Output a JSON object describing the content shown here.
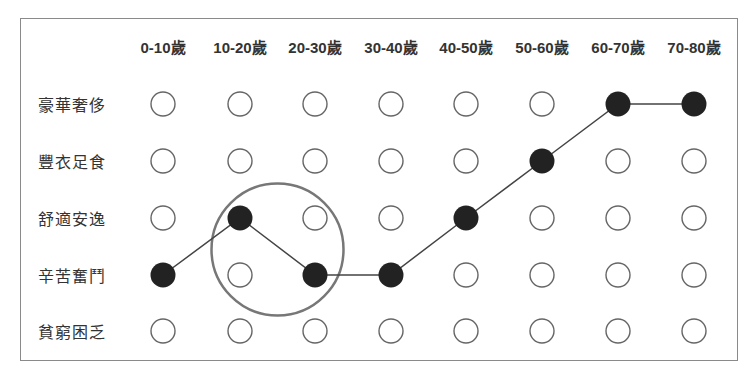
{
  "chart_data": {
    "type": "scatter",
    "title": "",
    "columns": [
      "0-10歲",
      "10-20歲",
      "20-30歲",
      "30-40歲",
      "40-50歲",
      "50-60歲",
      "60-70歲",
      "70-80歲"
    ],
    "rows": [
      "豪華奢侈",
      "豐衣足食",
      "舒適安逸",
      "辛苦奮鬥",
      "貧窮困乏"
    ],
    "path": [
      {
        "age": "0-10歲",
        "level": "辛苦奮鬥"
      },
      {
        "age": "10-20歲",
        "level": "舒適安逸"
      },
      {
        "age": "20-30歲",
        "level": "辛苦奮鬥"
      },
      {
        "age": "30-40歲",
        "level": "辛苦奮鬥"
      },
      {
        "age": "40-50歲",
        "level": "舒適安逸"
      },
      {
        "age": "50-60歲",
        "level": "豐衣足食"
      },
      {
        "age": "60-70歲",
        "level": "豪華奢侈"
      },
      {
        "age": "70-80歲",
        "level": "豪華奢侈"
      }
    ],
    "path_row_index": [
      3,
      2,
      3,
      3,
      2,
      1,
      0,
      0
    ],
    "highlight": {
      "description": "circle around 10-20歲 to 20-30歲 dip",
      "center_col": 1.5,
      "center_row": 2.5
    }
  },
  "colors": {
    "line": "#444444",
    "filled": "#222222",
    "empty_stroke": "#666666",
    "highlight": "#777777"
  }
}
